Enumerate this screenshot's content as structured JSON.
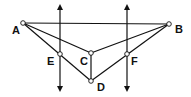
{
  "diagram": {
    "type": "geometry-figure",
    "colors": {
      "line": "#111111",
      "background": "#ffffff",
      "point_fill": "#ffffff"
    },
    "points": [
      {
        "id": "A",
        "label": "A",
        "x": 23,
        "y": 23,
        "lx": 12,
        "ly": 34
      },
      {
        "id": "B",
        "label": "B",
        "x": 169,
        "y": 24,
        "lx": 175,
        "ly": 33
      },
      {
        "id": "C",
        "label": "C",
        "x": 91,
        "y": 53,
        "lx": 80,
        "ly": 65
      },
      {
        "id": "D",
        "label": "D",
        "x": 91,
        "y": 81,
        "lx": 97,
        "ly": 91
      },
      {
        "id": "E",
        "label": "E",
        "x": 60,
        "y": 54,
        "lx": 47,
        "ly": 65
      },
      {
        "id": "F",
        "label": "F",
        "x": 127,
        "y": 54,
        "lx": 131,
        "ly": 65
      }
    ],
    "segments": [
      [
        "A",
        "B"
      ],
      [
        "A",
        "C"
      ],
      [
        "A",
        "D"
      ],
      [
        "B",
        "C"
      ],
      [
        "B",
        "D"
      ],
      [
        "C",
        "D"
      ]
    ],
    "arrow_lines": [
      {
        "id": "line-through-E",
        "x": 60,
        "y1": 4,
        "y2": 92
      },
      {
        "id": "line-through-F",
        "x": 127,
        "y1": 4,
        "y2": 92
      }
    ]
  }
}
